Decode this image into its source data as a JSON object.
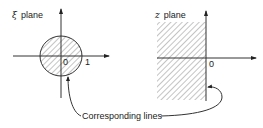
{
  "left_panel": {
    "label_symbol": "ξ",
    "label_text": "plane",
    "origin_label": "0",
    "unit_label": "1",
    "region": "unit disk (shaded)"
  },
  "right_panel": {
    "label_symbol": "z",
    "label_text": "plane",
    "origin_label": "0",
    "region": "left half-plane (shaded)"
  },
  "annotation": {
    "text": "Corresponding lines"
  },
  "colors": {
    "ink": "#333333",
    "background": "#ffffff"
  }
}
